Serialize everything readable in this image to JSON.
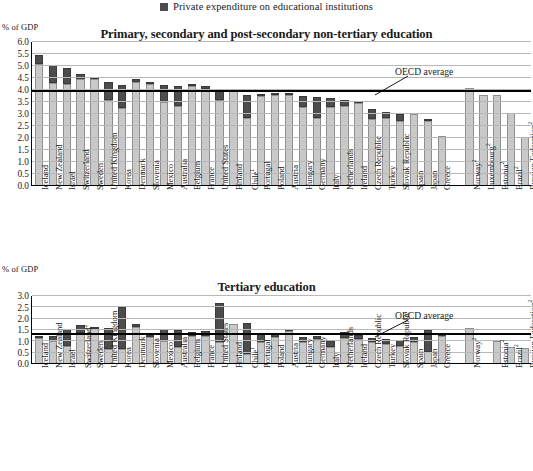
{
  "legend": {
    "swatch_color": "#4d4d4d",
    "label": "Private expenditure on educational institutions"
  },
  "colors": {
    "public": "#c9c9c9",
    "private": "#4d4d4d",
    "grid": "#b8b8b8",
    "oecd_line": "#000000"
  },
  "chart_data": [
    {
      "type": "bar",
      "id": "primary-secondary",
      "title": "Primary, secondary and post-secondary non-tertiary education",
      "ylabel": "% of GDP",
      "xlabel": "",
      "ylim": [
        0.0,
        6.0
      ],
      "ystep": 0.5,
      "yticks": [
        "0.0",
        "0.5",
        "1.0",
        "1.5",
        "2.0",
        "2.5",
        "3.0",
        "3.5",
        "4.0",
        "4.5",
        "5.0",
        "5.5",
        "6.0"
      ],
      "grid": true,
      "legend_position": "top-center",
      "stacked": true,
      "annotation": {
        "text": "OECD average",
        "value": 3.9
      },
      "series": [
        {
          "name": "Public expenditure on educational institutions",
          "color": "#c9c9c9"
        },
        {
          "name": "Private expenditure on educational institutions",
          "color": "#4d4d4d"
        }
      ],
      "categories": [
        "Iceland",
        "New Zealand",
        "Israel",
        "Switzerland",
        "Sweden",
        "United Kingdom",
        "Korea",
        "Denmark",
        "Slovenia",
        "Mexico",
        "Australia",
        "Belgium",
        "France",
        "United States",
        "Finland",
        "Chile¹",
        "Portugal",
        "Poland",
        "Austria",
        "Hungary",
        "Germany",
        "Italy",
        "Netherlands",
        "Ireland",
        "Czech Republic",
        "Turkey",
        "Slovak Republic",
        "Spain",
        "Japan",
        "Greece",
        "",
        "Norway²",
        "Luxembourg²",
        "Estonia²",
        "Brazil²",
        "Russian Federation²"
      ],
      "public_values": [
        5.1,
        4.3,
        4.25,
        4.45,
        4.45,
        3.6,
        3.25,
        4.35,
        4.25,
        3.5,
        3.35,
        4.15,
        4.05,
        3.6,
        3.95,
        2.85,
        3.75,
        3.8,
        3.8,
        3.3,
        2.85,
        3.3,
        3.35,
        3.45,
        2.8,
        2.85,
        2.7,
        3.0,
        2.7,
        2.1,
        null,
        4.1,
        3.8,
        3.8,
        3.05,
        2.05
      ],
      "private_values": [
        0.35,
        0.75,
        0.65,
        0.2,
        0.05,
        0.75,
        0.95,
        0.1,
        0.1,
        0.7,
        0.8,
        0.05,
        0.1,
        0.45,
        0.0,
        0.95,
        0.1,
        0.05,
        0.05,
        0.45,
        0.85,
        0.35,
        0.25,
        0.1,
        0.4,
        0.25,
        0.3,
        0.0,
        0.1,
        0.0,
        null,
        0.0,
        0.0,
        0.0,
        0.0,
        0.0
      ]
    },
    {
      "type": "bar",
      "id": "tertiary",
      "title": "Tertiary education",
      "ylabel": "% of GDP",
      "xlabel": "",
      "ylim": [
        0.0,
        3.0
      ],
      "ystep": 0.5,
      "yticks": [
        "0.0",
        "0.5",
        "1.0",
        "1.5",
        "2.0",
        "2.5",
        "3.0"
      ],
      "grid": true,
      "legend_position": "top-center",
      "stacked": true,
      "annotation": {
        "text": "OECD average",
        "value": 1.28
      },
      "series": [
        {
          "name": "Public expenditure on educational institutions",
          "color": "#c9c9c9"
        },
        {
          "name": "Private expenditure on educational institutions",
          "color": "#4d4d4d"
        }
      ],
      "categories": [
        "Iceland",
        "New Zealand",
        "Israel",
        "Switzerland²",
        "Sweden",
        "United Kingdom",
        "Korea",
        "Denmark",
        "Slovenia",
        "Mexico",
        "Australia",
        "Belgium",
        "France",
        "United States",
        "Finland",
        "Chile¹",
        "Portugal",
        "Poland",
        "Austria",
        "Hungary",
        "Germany",
        "Italy",
        "Netherlands",
        "Ireland",
        "Czech Republic",
        "Turkey",
        "Slovak Republic",
        "Spain",
        "Japan",
        "Greece",
        "",
        "Norway²",
        "",
        "Estonia²",
        "Brazil²",
        "Russian Federation²"
      ],
      "public_values": [
        1.15,
        1.0,
        0.8,
        1.35,
        1.55,
        0.65,
        0.65,
        1.65,
        1.2,
        1.0,
        0.75,
        1.25,
        1.25,
        0.95,
        1.75,
        0.45,
        0.95,
        1.2,
        1.45,
        0.95,
        1.1,
        0.75,
        1.15,
        1.1,
        0.95,
        0.9,
        0.8,
        0.95,
        0.55,
        1.25,
        null,
        1.6,
        null,
        1.0,
        0.75,
        0.7
      ],
      "private_values": [
        0.05,
        0.25,
        0.75,
        0.35,
        0.05,
        0.95,
        1.85,
        0.1,
        0.1,
        0.55,
        0.75,
        0.15,
        0.2,
        1.75,
        0.0,
        1.35,
        0.4,
        0.15,
        0.1,
        0.25,
        0.15,
        0.25,
        0.25,
        0.2,
        0.2,
        0.2,
        0.25,
        0.25,
        0.95,
        0.05,
        null,
        0.0,
        null,
        0.0,
        0.0,
        0.0
      ]
    }
  ]
}
